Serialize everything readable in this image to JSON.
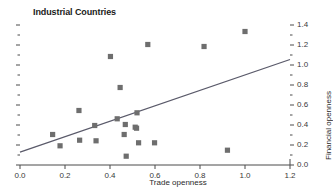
{
  "chart_data": {
    "type": "scatter",
    "title": "Industrial Countries",
    "xlabel": "Trade openness",
    "ylabel": "Financial openness",
    "xlim": [
      0.0,
      1.2
    ],
    "ylim": [
      0.0,
      1.45
    ],
    "grid": false,
    "legend": null,
    "xticks": [
      "0.0",
      "0.2",
      "0.4",
      "0.6",
      "0.8",
      "1.0",
      "1.2"
    ],
    "xtick_values": [
      0.0,
      0.2,
      0.4,
      0.6,
      0.8,
      1.0,
      1.2
    ],
    "ytick_values": [
      0.0,
      0.2,
      0.4,
      0.6,
      0.8,
      1.0,
      1.2,
      1.4
    ],
    "yticks": [
      "0.0",
      "0.2",
      "0.4",
      "0.6",
      "0.8",
      "1.0",
      "1.2",
      "1.4"
    ],
    "y_minor_values": [
      0.1,
      0.3,
      0.5,
      0.7,
      0.9,
      1.1,
      1.3
    ],
    "marker": "square",
    "marker_color": "#6e6e6e",
    "line_color": "#5a5a6a",
    "axis_color": "#4a4a4a",
    "points": [
      {
        "x": 0.145,
        "y": 0.305
      },
      {
        "x": 0.178,
        "y": 0.192
      },
      {
        "x": 0.262,
        "y": 0.545
      },
      {
        "x": 0.265,
        "y": 0.248
      },
      {
        "x": 0.332,
        "y": 0.395
      },
      {
        "x": 0.338,
        "y": 0.242
      },
      {
        "x": 0.402,
        "y": 1.085
      },
      {
        "x": 0.432,
        "y": 0.462
      },
      {
        "x": 0.445,
        "y": 0.775
      },
      {
        "x": 0.463,
        "y": 0.305
      },
      {
        "x": 0.468,
        "y": 0.405
      },
      {
        "x": 0.472,
        "y": 0.088
      },
      {
        "x": 0.512,
        "y": 0.378
      },
      {
        "x": 0.518,
        "y": 0.368
      },
      {
        "x": 0.52,
        "y": 0.522
      },
      {
        "x": 0.527,
        "y": 0.222
      },
      {
        "x": 0.568,
        "y": 1.205
      },
      {
        "x": 0.598,
        "y": 0.222
      },
      {
        "x": 0.818,
        "y": 1.185
      },
      {
        "x": 0.922,
        "y": 0.148
      },
      {
        "x": 1.0,
        "y": 1.335
      }
    ],
    "trendline": {
      "x0": 0.0,
      "y0": 0.128,
      "x1": 1.2,
      "y1": 1.055
    }
  }
}
